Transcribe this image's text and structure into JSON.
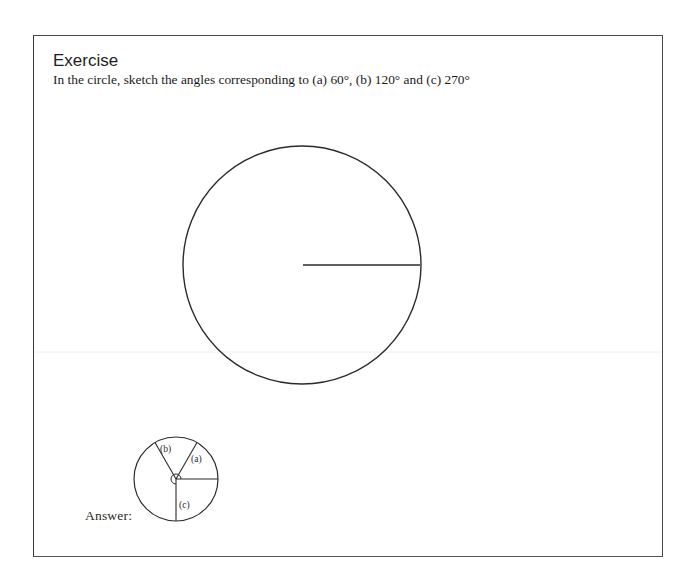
{
  "exercise": {
    "title": "Exercise",
    "prompt": "In the circle, sketch the angles corresponding to (a) 60°, (b) 120° and (c) 270°"
  },
  "main_figure": {
    "type": "circle-with-radius",
    "center": [
      302,
      265
    ],
    "radius": 119,
    "initial_ray_angle_deg": 0,
    "stroke_color": "#2b2b2b"
  },
  "answer": {
    "label": "Answer:",
    "figure": {
      "center": [
        176,
        479
      ],
      "radius": 42,
      "rays": [
        {
          "id": "initial",
          "angle_deg": 0,
          "label": ""
        },
        {
          "id": "a",
          "angle_deg": 60,
          "label": "(a)"
        },
        {
          "id": "b",
          "angle_deg": 120,
          "label": "(b)"
        },
        {
          "id": "c",
          "angle_deg": 270,
          "label": "(c)"
        }
      ]
    }
  }
}
